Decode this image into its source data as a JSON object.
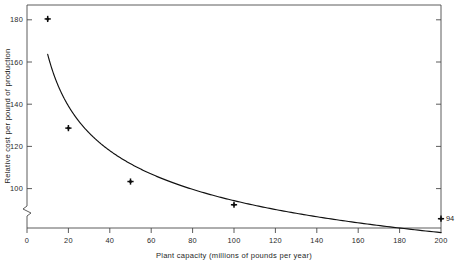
{
  "chart_data": {
    "type": "line",
    "title": "",
    "subtitle": "",
    "xlabel": "Plant capacity (millions of pounds per year)",
    "ylabel": "Relative cost per pound of production",
    "x": [
      10,
      20,
      50,
      100,
      200
    ],
    "values": [
      180,
      133,
      110,
      100,
      94
    ],
    "series": [
      {
        "name": "Relative cost per pound of production",
        "x": [
          10,
          20,
          50,
          100,
          200
        ],
        "values": [
          180,
          133,
          110,
          100,
          94
        ],
        "marker": "cross",
        "line_style": "solid"
      }
    ],
    "xlim": [
      0,
      200
    ],
    "ylim": [
      90,
      186
    ],
    "xticks": [
      0,
      20,
      40,
      60,
      80,
      100,
      120,
      140,
      160,
      180,
      200
    ],
    "xtick_labels": [
      "0",
      "20",
      "40",
      "60",
      "80",
      "100",
      "120",
      "140",
      "160",
      "180",
      "200"
    ],
    "yticks": [
      100,
      120,
      140,
      160,
      180
    ],
    "ytick_labels": [
      "100",
      "120",
      "140",
      "160",
      "180"
    ],
    "grid": false,
    "legend": null,
    "legend_position": "none",
    "axis_break": {
      "axis": "y",
      "present": true,
      "note": "zigzag break between 0 and 100 on vertical axis"
    },
    "annotations": [
      {
        "text": "94",
        "x": 200,
        "y": 94,
        "position": "right-of-point"
      }
    ],
    "frame": {
      "top": true,
      "right": true,
      "bottom": true,
      "left": true
    },
    "colors": {
      "line": "#111111",
      "marker": "#0d0d0d",
      "axis": "#4a4a4a",
      "background": "#ffffff",
      "text": "#1a1a1a"
    }
  },
  "axes": {
    "x_title": "Plant capacity (millions of pounds per year)",
    "y_title": "Relative cost per pound of production",
    "x_ticks": [
      "0",
      "20",
      "40",
      "60",
      "80",
      "100",
      "120",
      "140",
      "160",
      "180",
      "200"
    ],
    "y_ticks": [
      "180",
      "160",
      "140",
      "120",
      "100"
    ]
  },
  "annotation": {
    "end_value": "94"
  }
}
